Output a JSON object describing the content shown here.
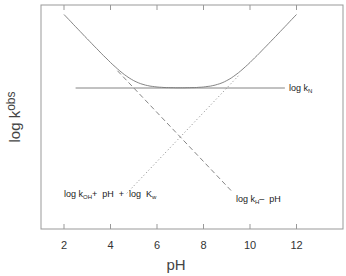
{
  "chart_data": {
    "type": "line",
    "title": "",
    "xlabel": "pH",
    "ylabel": "log k",
    "ylabel_sub": "obs",
    "xlim": [
      1,
      14
    ],
    "ylim": [
      -5.76,
      3.39
    ],
    "xticks": [
      2,
      4,
      6,
      8,
      10,
      12
    ],
    "xtick_labels": [
      "2",
      "4",
      "6",
      "8",
      "10",
      "12"
    ],
    "yticks": [],
    "grid": false,
    "legend": "none",
    "series": [
      {
        "name": "log k_obs",
        "style": "solid",
        "x": [
          2,
          3,
          4,
          4.5,
          5,
          5.5,
          6,
          6.5,
          7,
          7.5,
          8,
          8.5,
          9,
          9.5,
          10,
          11,
          12
        ],
        "values": [
          3.0,
          2.0,
          1.04,
          0.61,
          0.26,
          0.06,
          0.0,
          0.0,
          0.0,
          0.0,
          0.0,
          0.06,
          0.26,
          0.61,
          1.04,
          2.0,
          3.0
        ]
      },
      {
        "name": "log k_N",
        "style": "solid",
        "x": [
          2.5,
          11.5
        ],
        "values": [
          0,
          0
        ]
      },
      {
        "name": "log k_H - pH",
        "style": "dashed",
        "x": [
          4.3,
          9.2
        ],
        "values": [
          0.7,
          -4.2
        ]
      },
      {
        "name": "log k_OH + pH + log K_w",
        "style": "dotted",
        "x": [
          4.7,
          9.5
        ],
        "values": [
          -4.3,
          0.5
        ]
      }
    ],
    "annotations": [
      {
        "text": "log k",
        "sub": "N",
        "x": 11.8,
        "y": 0
      },
      {
        "text_parts": [
          "log k",
          "OH",
          "+ pH + log K",
          "w"
        ],
        "x": 2.0,
        "y": -4.05
      },
      {
        "text_parts": [
          "log k",
          "H",
          "– pH"
        ],
        "x": 9.2,
        "y": -4.3
      }
    ]
  },
  "labels": {
    "x_axis": "pH",
    "y_axis_main": "log k",
    "y_axis_sub": "obs",
    "kn_main": "log k",
    "kn_sub": "N",
    "koh_a": "log k",
    "koh_sub": "OH",
    "koh_b": "+  pH  +  log  K",
    "koh_sub2": "w",
    "kh_a": "log k",
    "kh_sub": "H",
    "kh_b": "–  pH"
  }
}
